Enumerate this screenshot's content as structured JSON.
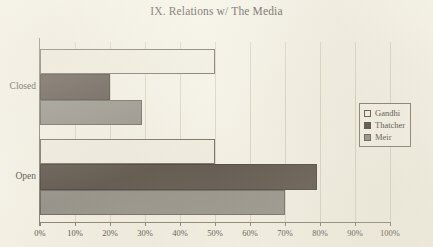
{
  "chart_data": {
    "type": "bar",
    "orientation": "horizontal",
    "title": "IX. Relations w/ The Media",
    "xlabel": "",
    "ylabel": "",
    "categories": [
      "Closed",
      "Open"
    ],
    "series": [
      {
        "name": "Gandhi",
        "values": [
          50,
          50
        ],
        "color": "#efece0"
      },
      {
        "name": "Thatcher",
        "values": [
          20,
          79
        ],
        "color": "#3a2f28"
      },
      {
        "name": "Meir",
        "values": [
          29,
          70
        ],
        "color": "#7d7a73"
      }
    ],
    "xlim": [
      0,
      100
    ],
    "xticks": [
      0,
      10,
      20,
      30,
      40,
      50,
      60,
      70,
      80,
      90,
      100
    ],
    "xtick_labels": [
      "0%",
      "10%",
      "20%",
      "30%",
      "40%",
      "50%",
      "60%",
      "70%",
      "80%",
      "90%",
      "100%"
    ],
    "grid": true,
    "legend_position": "right"
  },
  "legend": {
    "entries": [
      {
        "label": "Gandhi",
        "swatch": "legend-swatch-open-square"
      },
      {
        "label": "Thatcher",
        "swatch": "legend-swatch-filled-square"
      },
      {
        "label": "Meir",
        "swatch": "legend-swatch-gray-square"
      }
    ]
  }
}
